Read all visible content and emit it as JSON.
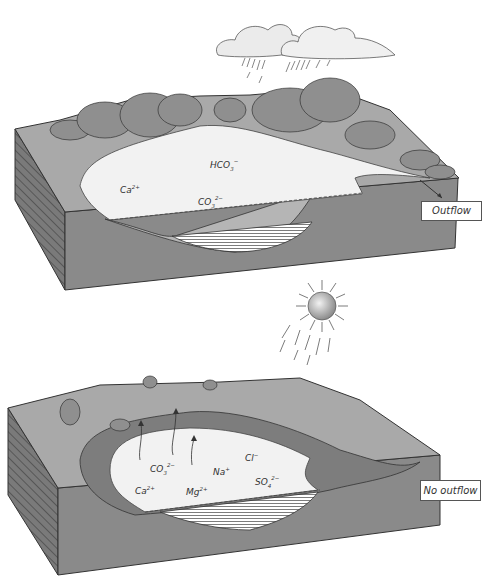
{
  "panels": [
    {
      "id": "top",
      "title": "Open lake with outflow (humid climate)",
      "callout": "Outflow",
      "weather": "rain-clouds",
      "ions": [
        {
          "base": "HCO",
          "sub": "3",
          "sup": "−"
        },
        {
          "base": "Ca",
          "sub": "",
          "sup": "2+"
        },
        {
          "base": "CO",
          "sub": "3",
          "sup": "2−"
        }
      ]
    },
    {
      "id": "bottom",
      "title": "Closed basin lake without outflow (arid climate)",
      "callout": "No outflow",
      "weather": "sun-evaporation",
      "ions": [
        {
          "base": "CO",
          "sub": "3",
          "sup": "2−"
        },
        {
          "base": "Na",
          "sub": "",
          "sup": "+"
        },
        {
          "base": "Cl",
          "sub": "",
          "sup": "−"
        },
        {
          "base": "SO",
          "sub": "4",
          "sup": "2−"
        },
        {
          "base": "Ca",
          "sub": "",
          "sup": "2+"
        },
        {
          "base": "Mg",
          "sub": "",
          "sup": "2+"
        }
      ]
    }
  ],
  "colors": {
    "land_top": "#a9a9a9",
    "block_front": "#8a8a8a",
    "block_side": "#777777",
    "lake": "#f2f2f2",
    "vegetation": "#8f8f8f",
    "salt_crust": "#7d7d7d",
    "cloud": "#ebebeb",
    "sediment": "#ffffff",
    "outline": "#333333"
  }
}
